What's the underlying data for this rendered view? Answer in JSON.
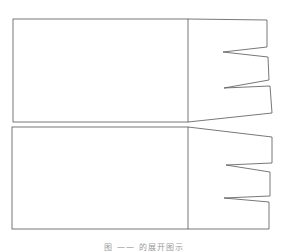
{
  "figure": {
    "stroke_color": "#555555",
    "background": "#ffffff",
    "panels": [
      {
        "name": "top-pattern",
        "rect": {
          "x1": 13,
          "y1": 19,
          "x2": 188,
          "y2": 122
        },
        "flap_outline": [
          [
            188,
            19
          ],
          [
            267,
            20
          ],
          [
            267,
            47
          ],
          [
            223,
            52
          ],
          [
            268,
            57
          ],
          [
            269,
            80
          ],
          [
            224,
            88
          ],
          [
            270,
            86
          ],
          [
            272,
            113
          ],
          [
            188,
            122
          ]
        ]
      },
      {
        "name": "bottom-pattern",
        "rect": {
          "x1": 12,
          "y1": 127,
          "x2": 188,
          "y2": 229
        },
        "flap_outline": [
          [
            188,
            127
          ],
          [
            272,
            137
          ],
          [
            272,
            163
          ],
          [
            226,
            165
          ],
          [
            270,
            172
          ],
          [
            270,
            196
          ],
          [
            224,
            198
          ],
          [
            269,
            202
          ],
          [
            269,
            229
          ],
          [
            188,
            229
          ]
        ]
      }
    ]
  },
  "caption": {
    "text": "图 —— 的展开图示"
  }
}
